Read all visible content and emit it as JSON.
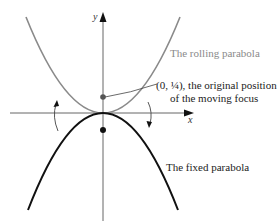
{
  "diagram": {
    "axes": {
      "x_label": "x",
      "y_label": "y"
    },
    "labels": {
      "rolling": "The rolling parabola",
      "focus_line1": "(0, ¼), the original position",
      "focus_line2": "of the moving focus",
      "fixed": "The fixed parabola"
    },
    "colors": {
      "rolling_curve": "#8a8a8a",
      "fixed_curve": "#111111",
      "axis": "#555555",
      "background": "#ffffff"
    },
    "points": [
      {
        "name": "original focus",
        "coords": "(0, 1/4)",
        "color": "#555555"
      },
      {
        "name": "fixed focus",
        "coords": "(0, -1/4)",
        "color": "#111111"
      }
    ]
  }
}
